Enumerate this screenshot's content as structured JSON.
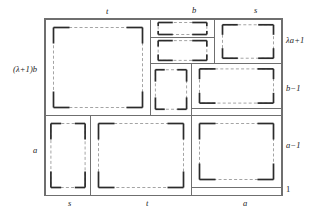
{
  "figure": {
    "type": "rectangle-dissection-diagram",
    "canvas": {
      "width": 327,
      "height": 220
    },
    "outer_rect": {
      "x": 44,
      "y": 18,
      "w": 238,
      "h": 177
    },
    "labels": {
      "top": [
        {
          "id": "top-t",
          "text": "t",
          "x": 106,
          "y": 7
        },
        {
          "id": "top-b",
          "text": "b",
          "x": 192,
          "y": 6
        },
        {
          "id": "top-s",
          "text": "s",
          "x": 254,
          "y": 6
        }
      ],
      "left": [
        {
          "id": "left-lambda1b",
          "text": "(λ+1)b",
          "x": 13,
          "y": 65
        },
        {
          "id": "left-a",
          "text": "a",
          "x": 33,
          "y": 146
        }
      ],
      "right": [
        {
          "id": "right-lambda-a1",
          "text": "λa+1",
          "x": 286,
          "y": 36
        },
        {
          "id": "right-b-1",
          "text": "b−1",
          "x": 286,
          "y": 84
        },
        {
          "id": "right-a-1",
          "text": "a−1",
          "x": 286,
          "y": 141
        },
        {
          "id": "right-one",
          "text": "1",
          "x": 286,
          "y": 185,
          "upright": true
        }
      ],
      "bottom": [
        {
          "id": "bottom-s",
          "text": "s",
          "x": 68,
          "y": 199
        },
        {
          "id": "bottom-t",
          "text": "t",
          "x": 146,
          "y": 199
        },
        {
          "id": "bottom-a",
          "text": "a",
          "x": 243,
          "y": 199
        }
      ]
    },
    "cells": [
      {
        "id": "cell-t-by-lambda1b",
        "x": 45,
        "y": 19,
        "w": 105,
        "h": 96
      },
      {
        "id": "cell-b-top",
        "x": 150,
        "y": 19,
        "w": 64,
        "h": 18
      },
      {
        "id": "cell-b-mid",
        "x": 150,
        "y": 37,
        "w": 64,
        "h": 26
      },
      {
        "id": "cell-s-top",
        "x": 214,
        "y": 19,
        "w": 67,
        "h": 44
      },
      {
        "id": "cell-mid-left",
        "x": 150,
        "y": 63,
        "w": 41,
        "h": 52
      },
      {
        "id": "cell-b-1-right",
        "x": 191,
        "y": 63,
        "w": 90,
        "h": 45
      },
      {
        "id": "cell-thin-strip",
        "x": 191,
        "y": 108,
        "w": 90,
        "h": 7
      },
      {
        "id": "cell-a-left",
        "x": 45,
        "y": 115,
        "w": 45,
        "h": 80
      },
      {
        "id": "cell-t-bottom",
        "x": 90,
        "y": 115,
        "w": 101,
        "h": 80
      },
      {
        "id": "cell-a-1-right",
        "x": 191,
        "y": 115,
        "w": 90,
        "h": 72
      },
      {
        "id": "cell-one-right",
        "x": 191,
        "y": 187,
        "w": 90,
        "h": 8
      }
    ],
    "colors": {
      "outline": "#6f6f6f",
      "dashed": "#9a9a9a",
      "corner_mark": "#2b2b2b",
      "text": "#1b1b1b",
      "background": "#ffffff"
    }
  }
}
